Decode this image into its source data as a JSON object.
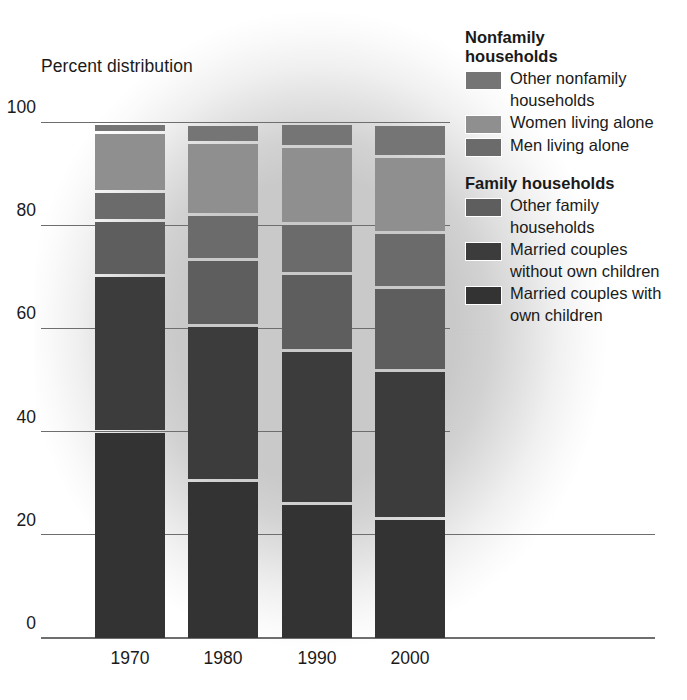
{
  "axis_title": "Percent distribution",
  "legend": {
    "group1_title": "Nonfamily households",
    "group1_title_l1": "Nonfamily",
    "group1_title_l2": "households",
    "group2_title": "Family households",
    "items": [
      {
        "label": "Other nonfamily households",
        "color": "#757575",
        "key": "other_nonfamily"
      },
      {
        "label": "Women living alone",
        "color": "#8f8f8f",
        "key": "women_alone"
      },
      {
        "label": "Men living alone",
        "color": "#6b6b6b",
        "key": "men_alone"
      },
      {
        "label": "Other family households",
        "color": "#5e5e5e",
        "key": "other_family"
      },
      {
        "label": "Married couples without own children",
        "color": "#3c3c3c",
        "key": "married_without"
      },
      {
        "label": "Married couples with own children",
        "color": "#333333",
        "key": "married_with"
      }
    ]
  },
  "chart_data": {
    "type": "bar",
    "title": "Percent distribution",
    "subtype": "stacked-100-percent",
    "xlabel": "",
    "ylabel": "Percent distribution",
    "ylim": [
      0,
      100
    ],
    "yticks": [
      0,
      20,
      40,
      60,
      80,
      100
    ],
    "ytick_labels": [
      "0",
      "20",
      "40",
      "60",
      "80",
      "100"
    ],
    "grid": true,
    "legend_position": "right",
    "categories": [
      "1970",
      "1980",
      "1990",
      "2000"
    ],
    "stack_order_bottom_to_top": [
      "married_with",
      "married_without",
      "other_family",
      "men_alone",
      "women_alone",
      "other_nonfamily"
    ],
    "series": [
      {
        "name": "Married couples with own children",
        "key": "married_with",
        "color": "#333333",
        "values": [
          40.3,
          30.9,
          26.3,
          23.5
        ]
      },
      {
        "name": "Married couples without own children",
        "key": "married_without",
        "color": "#3c3c3c",
        "values": [
          30.3,
          29.9,
          29.8,
          28.7
        ]
      },
      {
        "name": "Other family households",
        "key": "other_family",
        "color": "#5e5e5e",
        "values": [
          10.6,
          12.9,
          14.8,
          16.0
        ]
      },
      {
        "name": "Men living alone",
        "key": "men_alone",
        "color": "#6b6b6b",
        "values": [
          5.6,
          8.6,
          9.7,
          10.7
        ]
      },
      {
        "name": "Women living alone",
        "key": "women_alone",
        "color": "#8f8f8f",
        "values": [
          11.5,
          14.0,
          14.9,
          14.8
        ]
      },
      {
        "name": "Other nonfamily households",
        "key": "other_nonfamily",
        "color": "#757575",
        "values": [
          1.7,
          3.6,
          4.6,
          6.2
        ]
      }
    ]
  }
}
